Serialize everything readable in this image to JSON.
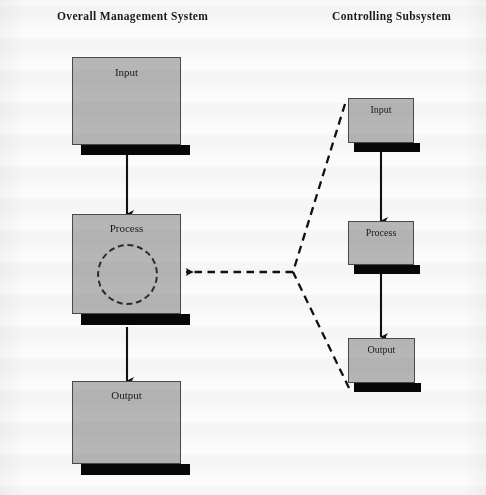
{
  "diagram": {
    "title_left": "Overall Management System",
    "title_right": "Controlling Subsystem",
    "colors": {
      "box_fill": "#b6b6b6",
      "box_border": "#4a4a4a",
      "shadow": "#070707",
      "line": "#111111",
      "background": "#fbfbfb",
      "text": "#1a1a1a"
    },
    "left_column": {
      "header": "Overall Management System",
      "nodes": [
        {
          "id": "left-input",
          "label": "Input"
        },
        {
          "id": "left-process",
          "label": "Process"
        },
        {
          "id": "left-output",
          "label": "Output"
        }
      ],
      "process_has_dashed_circle": true
    },
    "right_column": {
      "header": "Controlling Subsystem",
      "nodes": [
        {
          "id": "right-input",
          "label": "Input"
        },
        {
          "id": "right-process",
          "label": "Process"
        },
        {
          "id": "right-output",
          "label": "Output"
        }
      ]
    },
    "connectors": [
      {
        "id": "left-input-to-process",
        "style": "solid",
        "arrow": "down"
      },
      {
        "id": "left-process-to-output",
        "style": "solid",
        "arrow": "down"
      },
      {
        "id": "right-input-to-process",
        "style": "solid",
        "arrow": "down"
      },
      {
        "id": "right-process-to-output",
        "style": "solid",
        "arrow": "down"
      },
      {
        "id": "feedback-to-left-process",
        "style": "dashed",
        "arrow": "left"
      },
      {
        "id": "feedback-from-right-input",
        "style": "dashed",
        "arrow": "none"
      },
      {
        "id": "feedback-from-right-output",
        "style": "dashed",
        "arrow": "none"
      }
    ]
  }
}
